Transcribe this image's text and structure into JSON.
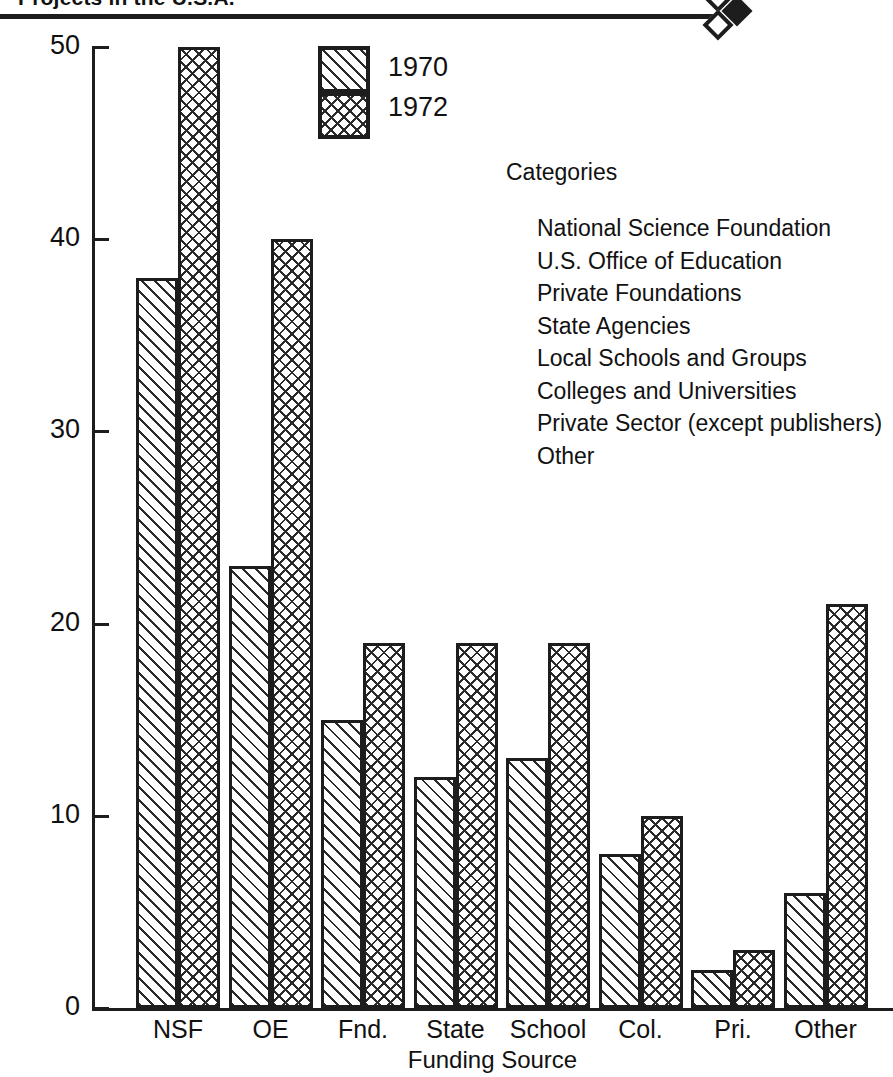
{
  "header": {
    "title": "Projects in the U.S.A.",
    "marker_filled": "filled-diamond",
    "marker_outline": "outline-diamond"
  },
  "legend": {
    "items": [
      {
        "label": "1970",
        "pattern": "diagonal-hatch"
      },
      {
        "label": "1972",
        "pattern": "cross-hatch"
      }
    ]
  },
  "categories_panel": {
    "heading": "Categories",
    "items": [
      "National Science Foundation",
      "U.S. Office of Education",
      "Private Foundations",
      "State Agencies",
      "Local Schools and Groups",
      "Colleges and Universities",
      "Private Sector (except publishers)",
      "Other"
    ]
  },
  "chart_data": {
    "type": "bar",
    "title": "Projects in the U.S.A.",
    "xlabel": "Funding Source",
    "ylabel": "Number of Projects",
    "categories": [
      "NSF",
      "OE",
      "Fnd.",
      "State",
      "School",
      "Col.",
      "Pri.",
      "Other"
    ],
    "series": [
      {
        "name": "1970",
        "values": [
          38,
          23,
          15,
          12,
          13,
          8,
          2,
          6
        ]
      },
      {
        "name": "1972",
        "values": [
          50,
          40,
          19,
          19,
          19,
          10,
          3,
          21
        ]
      }
    ],
    "ylim": [
      0,
      50
    ],
    "yticks": [
      0,
      10,
      20,
      30,
      40,
      50
    ],
    "ytick_labels": [
      "0",
      "10",
      "20",
      "30",
      "40",
      "50"
    ],
    "grid": false,
    "legend_position": "top-center"
  },
  "colors": {
    "ink": "#1d1d1d",
    "background": "#ffffff"
  }
}
